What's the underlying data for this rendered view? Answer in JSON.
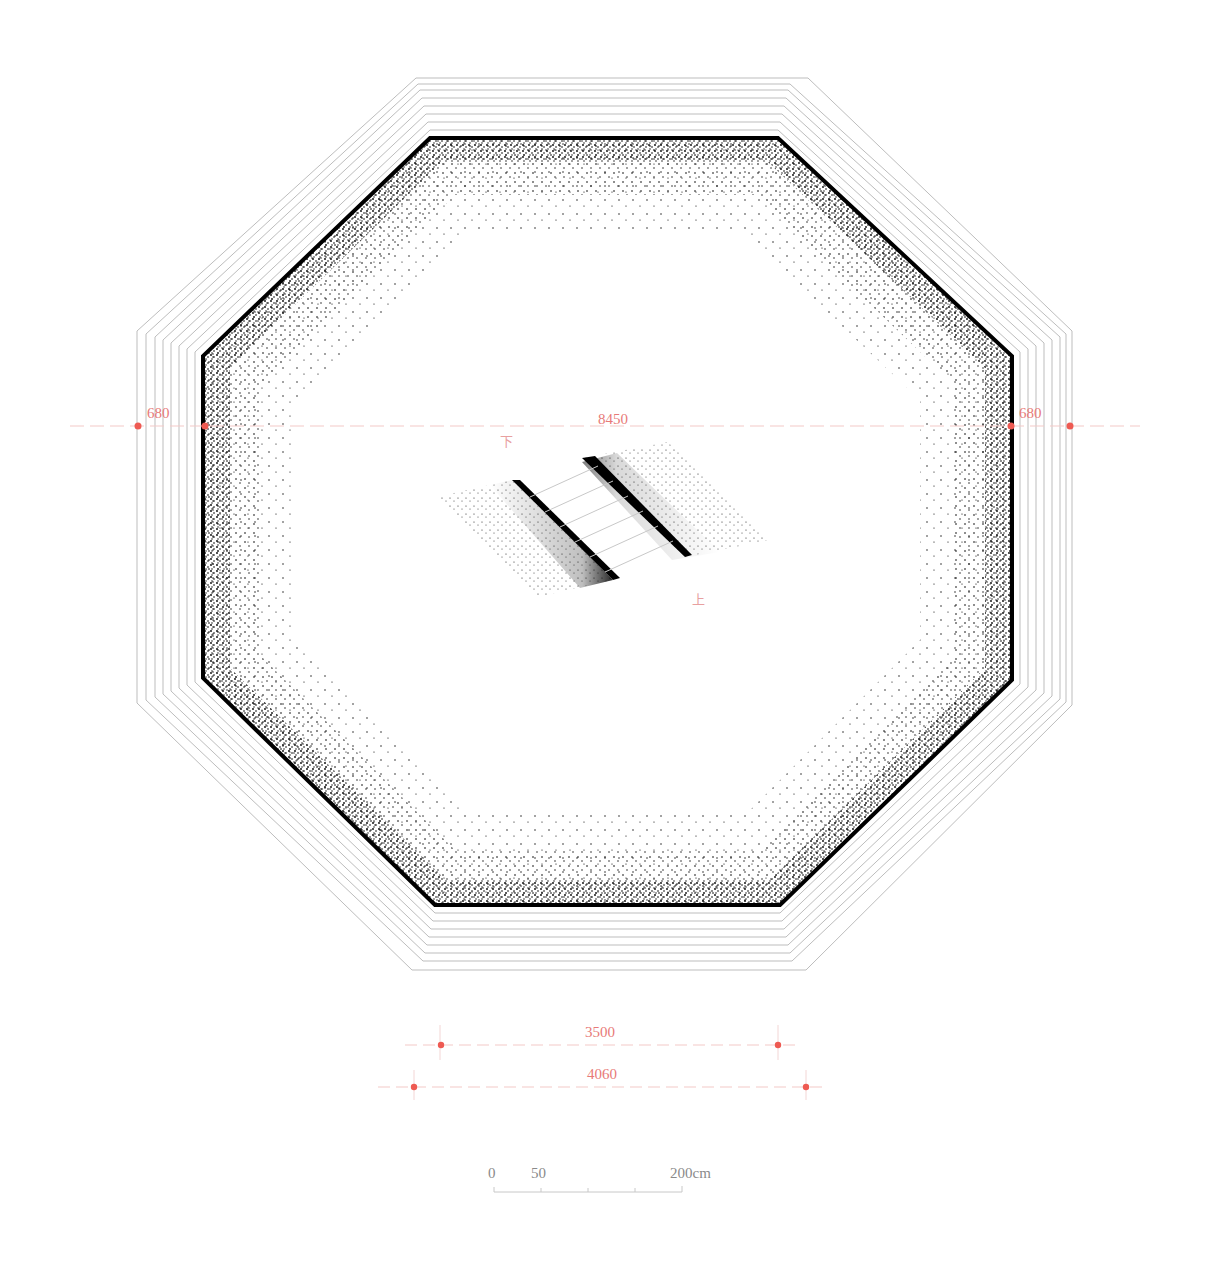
{
  "drawing": {
    "type": "octagonal pit plan with stippled walls and central ramp/staircase",
    "colors": {
      "wall": "#000000",
      "ring_lines": "#bdbdbd",
      "dimension": "#e87a78",
      "dimension_dot": "#ee5a52",
      "scale_text": "#8a8a8a"
    }
  },
  "dimensions": {
    "horizontal": {
      "left_offset": "680",
      "span": "8450",
      "right_offset": "680"
    },
    "bottom": {
      "inner_edge": "3500",
      "outer_edge": "4060"
    }
  },
  "stair": {
    "label_down": "下",
    "label_up": "上"
  },
  "scale_bar": {
    "tick_0": "0",
    "tick_50": "50",
    "tick_end": "200cm"
  }
}
